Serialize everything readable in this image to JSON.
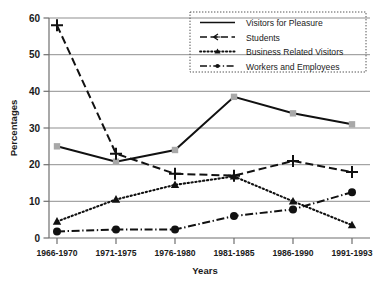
{
  "chart_data": {
    "type": "line",
    "title": "",
    "xlabel": "Years",
    "ylabel": "Percentages",
    "categories": [
      "1966-1970",
      "1971-1975",
      "1976-1980",
      "1981-1985",
      "1986-1990",
      "1991-1993"
    ],
    "ylim": [
      0,
      60
    ],
    "yticks": [
      0,
      10,
      20,
      30,
      40,
      50,
      60
    ],
    "ytick_labels": [
      "0",
      "10",
      "20",
      "30",
      "40",
      "50",
      "60"
    ],
    "grid": true,
    "grid_axis": "y",
    "legend_position": "top-right",
    "series": [
      {
        "name": "Visitors for Pleasure",
        "values": [
          25,
          20.8,
          24,
          38.5,
          34,
          31
        ],
        "line_style": "solid",
        "marker": "square",
        "marker_color": "#a8a8a8",
        "color": "#111111"
      },
      {
        "name": "Students",
        "values": [
          58,
          23,
          17.5,
          17,
          21,
          18
        ],
        "line_style": "dashed",
        "marker": "plus",
        "marker_color": "#111111",
        "color": "#111111"
      },
      {
        "name": "Business Related Visitors",
        "values": [
          4.5,
          10.5,
          14.5,
          16.8,
          10,
          3.5
        ],
        "line_style": "dotted",
        "marker": "triangle",
        "marker_color": "#111111",
        "color": "#111111"
      },
      {
        "name": "Workers and Employees",
        "values": [
          1.8,
          2.3,
          2.3,
          6,
          7.8,
          12.5
        ],
        "line_style": "dashdot",
        "marker": "circle",
        "marker_color": "#111111",
        "color": "#111111"
      }
    ]
  },
  "legend": {
    "items": [
      {
        "label": "Visitors for Pleasure"
      },
      {
        "label": "Students"
      },
      {
        "label": "Business Related Visitors"
      },
      {
        "label": "Workers and Employees"
      }
    ]
  },
  "axes": {
    "y_label": "Percentages",
    "x_label": "Years"
  }
}
